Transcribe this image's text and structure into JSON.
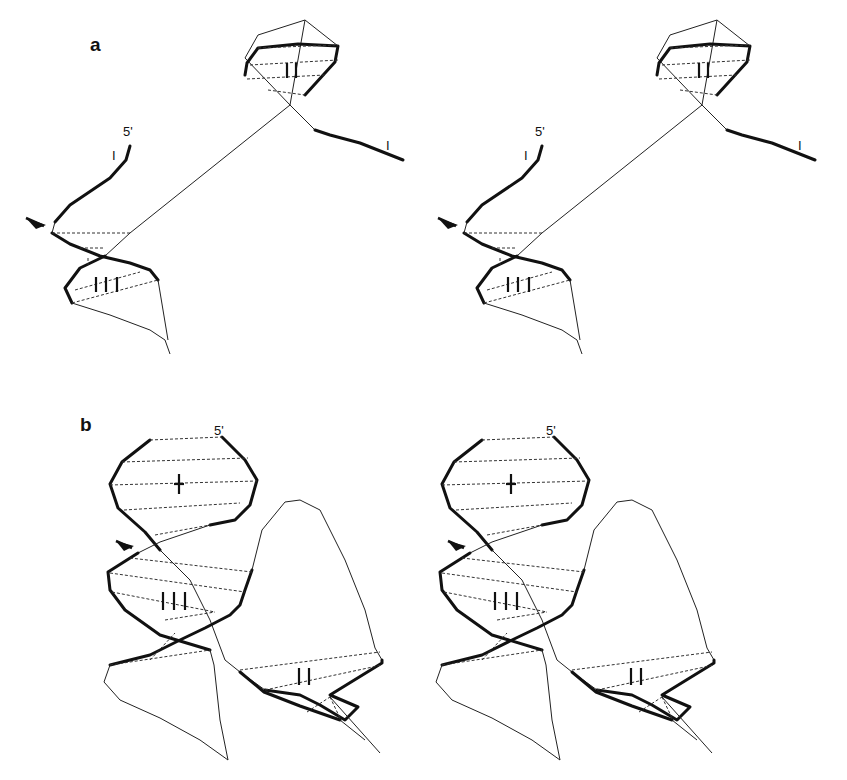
{
  "figure": {
    "type": "stereo-pair strand trace diagram",
    "panels": [
      {
        "id": "a",
        "label": "a",
        "end_label": "5'",
        "strand_markers": [
          "I",
          "I"
        ],
        "stem_labels": [
          "II",
          "III"
        ],
        "has_arrow": true,
        "views": [
          "left",
          "right"
        ]
      },
      {
        "id": "b",
        "label": "b",
        "end_label": "5'",
        "stem_labels": [
          "I",
          "III",
          "II"
        ],
        "has_arrow": true,
        "views": [
          "left",
          "right"
        ]
      }
    ]
  },
  "labels": {
    "panel_a": "a",
    "panel_b": "b",
    "five_prime": "5'",
    "strand_mark": "I"
  },
  "colors": {
    "background": "#ffffff",
    "stroke": "#111111"
  }
}
